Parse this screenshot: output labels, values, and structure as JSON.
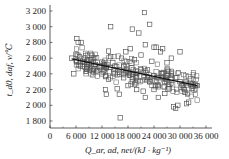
{
  "chart_data": {
    "type": "scatter",
    "title": "",
    "xlabel": "Q_ar, ad, net/(kJ · kg⁻¹)",
    "ylabel": "t_d0, daf, v/℃",
    "xlim": [
      0,
      36000
    ],
    "ylim": [
      1800,
      3200
    ],
    "grid": false,
    "legend": null,
    "x_ticks": [
      "0",
      "6 000",
      "12 000",
      "18 000",
      "24 000",
      "30 000",
      "36 000"
    ],
    "y_ticks": [
      "1 800",
      "2 000",
      "2 200",
      "2 400",
      "2 600",
      "2 800",
      "3 000",
      "3 200"
    ],
    "marker": "open-square",
    "fit_line": {
      "x": [
        5000,
        34000
      ],
      "y": [
        2590,
        2250
      ]
    },
    "series": [
      {
        "name": "samples",
        "points": [
          [
            5000,
            2600
          ],
          [
            5500,
            2400
          ],
          [
            6200,
            2850
          ],
          [
            6500,
            2800
          ],
          [
            7200,
            2800
          ],
          [
            6000,
            2650
          ],
          [
            6800,
            2620
          ],
          [
            7000,
            2500
          ],
          [
            8000,
            2550
          ],
          [
            8500,
            2470
          ],
          [
            9500,
            2580
          ],
          [
            10000,
            2600
          ],
          [
            10500,
            2520
          ],
          [
            11000,
            2440
          ],
          [
            11500,
            2480
          ],
          [
            12000,
            2550
          ],
          [
            12500,
            2450
          ],
          [
            12800,
            2200
          ],
          [
            13000,
            2140
          ],
          [
            13500,
            2690
          ],
          [
            13500,
            2330
          ],
          [
            14000,
            3000
          ],
          [
            14000,
            2620
          ],
          [
            14500,
            2540
          ],
          [
            15000,
            2400
          ],
          [
            15500,
            2210
          ],
          [
            16000,
            2140
          ],
          [
            16200,
            1840
          ],
          [
            16500,
            2600
          ],
          [
            17000,
            2500
          ],
          [
            17500,
            2680
          ],
          [
            18000,
            2420
          ],
          [
            18500,
            2720
          ],
          [
            19000,
            2970
          ],
          [
            19500,
            2580
          ],
          [
            20000,
            2350
          ],
          [
            20500,
            2920
          ],
          [
            21000,
            2640
          ],
          [
            21500,
            2180
          ],
          [
            21800,
            3180
          ],
          [
            22000,
            2770
          ],
          [
            22000,
            2100
          ],
          [
            22500,
            2450
          ],
          [
            23000,
            3030
          ],
          [
            23000,
            2300
          ],
          [
            23500,
            2560
          ],
          [
            24000,
            2740
          ],
          [
            24000,
            2380
          ],
          [
            24500,
            2740
          ],
          [
            25000,
            2250
          ],
          [
            25000,
            2100
          ],
          [
            25500,
            2680
          ],
          [
            26000,
            2400
          ],
          [
            26000,
            2720
          ],
          [
            26500,
            2300
          ],
          [
            27000,
            2540
          ],
          [
            27500,
            2210
          ],
          [
            28000,
            2600
          ],
          [
            28000,
            2380
          ],
          [
            28500,
            1980
          ],
          [
            29000,
            1960
          ],
          [
            29500,
            2000
          ],
          [
            30000,
            2680
          ],
          [
            30000,
            2300
          ],
          [
            30500,
            2250
          ],
          [
            31000,
            2200
          ],
          [
            31500,
            2020
          ],
          [
            32000,
            2040
          ],
          [
            32500,
            2280
          ],
          [
            33000,
            2240
          ],
          [
            33500,
            2260
          ],
          [
            34000,
            2250
          ],
          [
            19000,
            2300
          ],
          [
            20000,
            2200
          ],
          [
            21000,
            2450
          ],
          [
            22500,
            2350
          ],
          [
            24000,
            2200
          ],
          [
            26500,
            2150
          ],
          [
            27000,
            2300
          ],
          [
            29000,
            2350
          ],
          [
            18000,
            2250
          ],
          [
            17000,
            2350
          ],
          [
            16000,
            2420
          ],
          [
            15000,
            2500
          ],
          [
            14000,
            2480
          ],
          [
            12000,
            2400
          ],
          [
            10000,
            2460
          ],
          [
            9000,
            2520
          ],
          [
            8000,
            2600
          ],
          [
            7500,
            2560
          ]
        ]
      }
    ]
  }
}
